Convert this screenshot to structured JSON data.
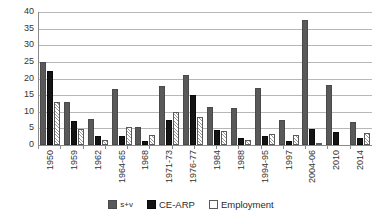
{
  "chart_data": {
    "type": "bar",
    "title": "",
    "subtitle": "",
    "xlabel": "",
    "ylabel": "",
    "ylim": [
      0,
      40
    ],
    "yticks": [
      0,
      5,
      10,
      15,
      20,
      25,
      30,
      35,
      40
    ],
    "ytick_labels": [
      "0",
      "5",
      "10",
      "15",
      "20",
      "25",
      "30",
      "35",
      "40"
    ],
    "grid": true,
    "legend_position": "bottom",
    "categories": [
      "1950",
      "1959",
      "1962",
      "1964-65",
      "1968",
      "1971-73",
      "1976-77",
      "1984",
      "1988",
      "1994-95",
      "1997",
      "2004-06",
      "2010",
      "2014"
    ],
    "series": [
      {
        "name": "s+v",
        "color": "#595959",
        "values": [
          25.0,
          13.0,
          7.7,
          16.9,
          5.4,
          17.6,
          21.2,
          11.5,
          11.2,
          17.1,
          7.4,
          37.5,
          18.0,
          7.0
        ]
      },
      {
        "name": "CE-ARP",
        "color": "#141414",
        "values": [
          22.3,
          7.2,
          2.8,
          2.8,
          1.1,
          7.6,
          15.0,
          4.4,
          2.2,
          2.7,
          1.2,
          4.8,
          4.0,
          2.2
        ]
      },
      {
        "name": "Employment",
        "color": "#ffffff",
        "values": [
          12.8,
          4.8,
          1.5,
          5.5,
          3.0,
          9.9,
          8.4,
          4.3,
          1.6,
          3.3,
          3.1,
          0.5,
          0.0,
          3.5
        ]
      }
    ]
  },
  "legend": {
    "items": [
      {
        "label": "s+v"
      },
      {
        "label": "CE-ARP"
      },
      {
        "label": "Employment"
      }
    ]
  }
}
